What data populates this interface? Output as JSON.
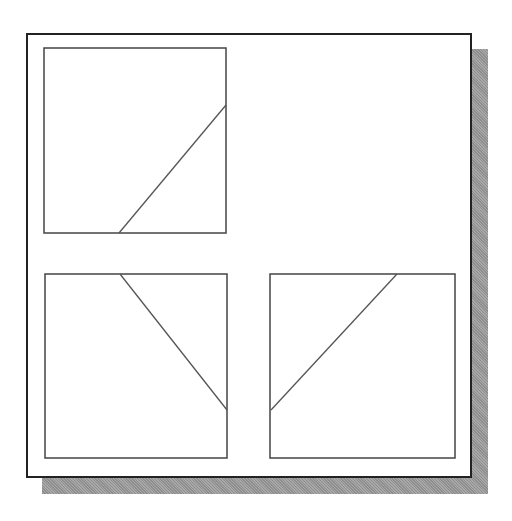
{
  "diagram": {
    "colors": {
      "frame_border": "#222222",
      "panel_border": "#444444",
      "line": "#555555",
      "shadow": "#9a9a9a",
      "background": "#ffffff"
    },
    "panels": [
      {
        "id": "top-left",
        "rect": {
          "x": 44,
          "y": 48,
          "w": 182,
          "h": 185
        },
        "line": {
          "x1": 119,
          "y1": 233,
          "x2": 226,
          "y2": 105
        }
      },
      {
        "id": "bottom-left",
        "rect": {
          "x": 45,
          "y": 274,
          "w": 182,
          "h": 184
        },
        "line": {
          "x1": 120,
          "y1": 274,
          "x2": 227,
          "y2": 410
        }
      },
      {
        "id": "bottom-right",
        "rect": {
          "x": 270,
          "y": 274,
          "w": 185,
          "h": 184
        },
        "line": {
          "x1": 397,
          "y1": 274,
          "x2": 271,
          "y2": 410
        }
      }
    ]
  }
}
